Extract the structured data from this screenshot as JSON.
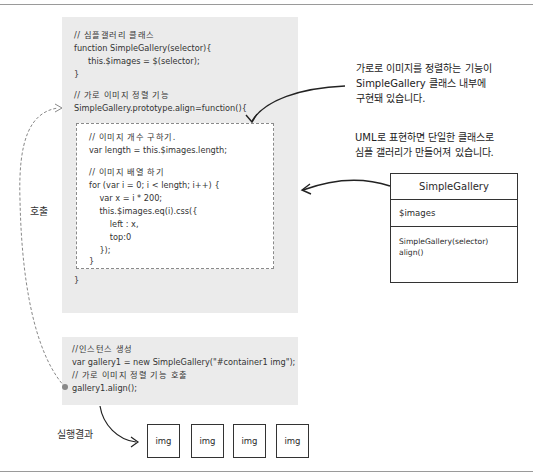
{
  "diagram": {
    "class_panel": {
      "class_comment": "// 심플갤러리 클래스",
      "constructor_line": "function SimpleGallery(selector){",
      "constructor_body": "this.$images = $(selector);",
      "constructor_close": "}",
      "method_comment": "// 가로 이미지 정렬 기능",
      "method_signature": "SimpleGallery.prototype.align=function(){",
      "method_close": "}"
    },
    "method_body": {
      "lines": [
        "// 이미지 개수 구하기.",
        "var length = this.$images.length;",
        "",
        "// 이미지 배열 하기",
        "for (var i = 0; i < length; i++) {",
        "    var x = i * 200;",
        "    this.$images.eq(i).css({",
        "        left : x,",
        "        top:0",
        "    });",
        "}"
      ]
    },
    "instance_panel": {
      "lines": [
        "//인스턴스 생성",
        "var gallery1 = new SimpleGallery(\"#container1 img\");",
        "// 가로 이미지 정렬 기능 호출",
        "gallery1.align();"
      ]
    },
    "notes": {
      "note1": "가로로 이미지를 정렬하는 기능이\nSimpleGallery 클래스 내부에\n구현돼 있습니다.",
      "note2": "UML로 표현하면 단일한 클래스로\n심플 갤러리가 만들어져 있습니다."
    },
    "uml": {
      "class_name": "SimpleGallery",
      "attributes": "$images",
      "operations": "SimpleGallery(selector)\nalign()"
    },
    "labels": {
      "call": "호출",
      "result": "실행결과"
    },
    "result_boxes": [
      "img",
      "img",
      "img",
      "img"
    ],
    "colors": {
      "panel": "#ebebeb",
      "dashed_border": "#8a8a8a",
      "line": "#333333"
    }
  }
}
